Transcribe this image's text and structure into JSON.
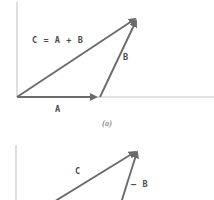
{
  "figure": {
    "background_color": "#ffffff",
    "vector_color": "#6b6b6b",
    "axis_color": "#bfbfbf",
    "label_color": "#4a4a4a",
    "caption_color": "#595959",
    "panel_a": {
      "caption": "(a)",
      "labels": {
        "resultant": "C = A + B",
        "vector_b": "B",
        "vector_a": "A"
      },
      "axes": {
        "origin": [
          17,
          97
        ],
        "vertical_top": [
          17,
          2
        ],
        "horizontal_right": [
          214,
          97
        ]
      },
      "vectors": [
        {
          "name": "A",
          "start": [
            17,
            97
          ],
          "end": [
            100,
            97
          ],
          "label": "A"
        },
        {
          "name": "B",
          "start": [
            100,
            97
          ],
          "end": [
            138,
            17
          ],
          "label": "B"
        },
        {
          "name": "C",
          "start": [
            17,
            97
          ],
          "end": [
            138,
            17
          ],
          "label": "C = A + B"
        }
      ]
    },
    "panel_b": {
      "labels": {
        "resultant": "C",
        "vector_neg_b": "– B"
      },
      "axes": {
        "vertical_top": [
          16,
          145
        ],
        "vertical_bottom": [
          16,
          200
        ]
      },
      "vectors": [
        {
          "name": "C",
          "start": [
            55,
            200
          ],
          "end": [
            138,
            149
          ],
          "label": "C"
        },
        {
          "name": "-B",
          "start": [
            122,
            200
          ],
          "end": [
            138,
            149
          ],
          "label": "– B"
        }
      ]
    }
  }
}
